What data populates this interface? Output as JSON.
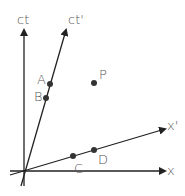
{
  "diagram": {
    "type": "spacetime-diagram",
    "axes": {
      "ct": {
        "label": "ct"
      },
      "ct_prime": {
        "label": "ct'"
      },
      "x": {
        "label": "x"
      },
      "x_prime": {
        "label": "x'"
      }
    },
    "points": [
      {
        "id": "A",
        "label": "A",
        "on": "ct'"
      },
      {
        "id": "B",
        "label": "B",
        "on": "ct'"
      },
      {
        "id": "P",
        "label": "P",
        "on": "free"
      },
      {
        "id": "C",
        "label": "C",
        "on": "x'"
      },
      {
        "id": "D",
        "label": "D",
        "on": "x'"
      }
    ],
    "colors": {
      "axis": "#222222",
      "point": "#333333",
      "label": "#555555",
      "background": "#ffffff"
    }
  }
}
